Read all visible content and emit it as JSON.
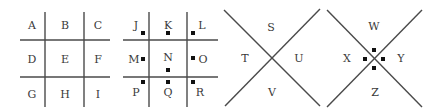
{
  "panels": [
    {
      "id": "grid-plain",
      "type": "grid",
      "labels": [
        "A",
        "B",
        "C",
        "D",
        "E",
        "F",
        "G",
        "H",
        "I"
      ]
    },
    {
      "id": "grid-dotted",
      "type": "grid-with-markers",
      "labels": [
        "J",
        "K",
        "L",
        "M",
        "N",
        "O",
        "P",
        "Q",
        "R"
      ]
    },
    {
      "id": "cross-plain",
      "type": "x-cross",
      "labels": {
        "top": "S",
        "left": "T",
        "right": "U",
        "bottom": "V"
      }
    },
    {
      "id": "cross-dotted",
      "type": "x-cross-with-markers",
      "labels": {
        "top": "W",
        "left": "X",
        "right": "Y",
        "bottom": "Z"
      }
    }
  ],
  "colors": {
    "line": "#4a4a4a",
    "text": "#3a3a3a",
    "marker": "#111111"
  }
}
